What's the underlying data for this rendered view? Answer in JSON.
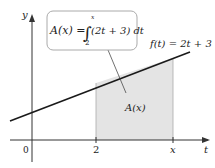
{
  "figure": {
    "formula_box": {
      "lhs": "A(x) =",
      "integral_sign": "∫",
      "upper_limit": "x",
      "lower_limit": "2",
      "integrand": "(2t + 3) dt"
    },
    "function_label": "f(t) = 2t + 3",
    "area_label": "A(x)",
    "axes": {
      "x_axis_label": "t",
      "y_axis_label": "y",
      "origin_label": "0",
      "tick_labels": [
        "2",
        "x"
      ]
    },
    "colors": {
      "shade": "#e4e4e4",
      "line": "#1a1a1a",
      "box_border": "#aaaaaa"
    }
  }
}
